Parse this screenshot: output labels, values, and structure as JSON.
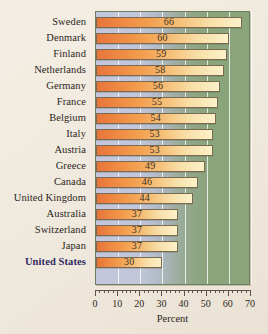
{
  "chart_data": {
    "type": "bar",
    "orientation": "horizontal",
    "title": "",
    "xlabel": "Percent",
    "ylabel": "",
    "xlim": [
      0,
      70
    ],
    "xticks": [
      0,
      10,
      20,
      30,
      40,
      50,
      60,
      70
    ],
    "minor_tick_step": 2,
    "grid": true,
    "grid_axis": "x",
    "legend": "none",
    "categories": [
      "Sweden",
      "Denmark",
      "Finland",
      "Netherlands",
      "Germany",
      "France",
      "Belgium",
      "Italy",
      "Austria",
      "Greece",
      "Canada",
      "United Kingdom",
      "Australia",
      "Switzerland",
      "Japan",
      "United States"
    ],
    "values": [
      66,
      60,
      59,
      58,
      56,
      55,
      54,
      53,
      53,
      49,
      46,
      44,
      37,
      37,
      37,
      30
    ],
    "highlight_category": "United States",
    "bar_labels": [
      "66",
      "60",
      "59",
      "58",
      "56",
      "55",
      "54",
      "53",
      "53",
      "49",
      "46",
      "44",
      "37",
      "37",
      "37",
      "30"
    ],
    "tick_labels": [
      "0",
      "10",
      "20",
      "30",
      "40",
      "50",
      "60",
      "70"
    ]
  },
  "colors": {
    "page_background": "#f1eae0",
    "bar_start": "#e8743a",
    "bar_end": "#fbf1c9",
    "bar_border": "#7a6a50",
    "panel_left": "#c3c7dd",
    "panel_right": "#8aa47b",
    "gridline": "#ffffff",
    "label_text": "#2b2622",
    "highlight_text": "#2f2b63",
    "axis": "#5c5446"
  }
}
